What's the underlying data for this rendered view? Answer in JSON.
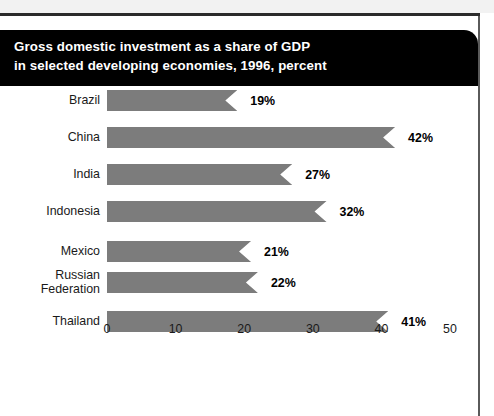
{
  "chart_data": {
    "type": "bar",
    "orientation": "horizontal",
    "title": "Gross domestic investment as a share of GDP in selected developing economies, 1996, percent",
    "title_lines": [
      "Gross domestic investment as a share of GDP",
      "in selected developing economies, 1996, percent"
    ],
    "categories": [
      "Brazil",
      "China",
      "India",
      "Indonesia",
      "Mexico",
      "Russian Federation",
      "Thailand"
    ],
    "values": [
      19,
      42,
      27,
      32,
      21,
      22,
      41
    ],
    "value_labels": [
      "19%",
      "42%",
      "27%",
      "32%",
      "21%",
      "22%",
      "41%"
    ],
    "xlabel": "",
    "ylabel": "",
    "xlim": [
      0,
      50
    ],
    "xticks": [
      0,
      10,
      20,
      30,
      40,
      50
    ],
    "xtick_labels": [
      "0",
      "10",
      "20",
      "30",
      "40",
      "50"
    ],
    "grid": false,
    "legend": false,
    "unit": "percent",
    "year": 1996,
    "bar_color": "#7c7c7c",
    "banner_color": "#000000",
    "banner_text_color": "#ffffff",
    "bar_style": "ribbon-notched-end"
  }
}
